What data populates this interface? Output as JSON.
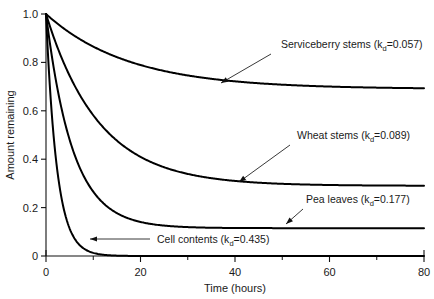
{
  "chart_data": {
    "type": "line",
    "title": "",
    "xlabel": "Time (hours)",
    "ylabel": "Amount remaining",
    "xlim": [
      0,
      80
    ],
    "ylim": [
      0,
      1.0
    ],
    "xticks": [
      0,
      20,
      40,
      60,
      80
    ],
    "xtick_labels": [
      "0",
      "20",
      "40",
      "60",
      "80"
    ],
    "xminor_ticks": [
      10,
      30,
      50,
      70
    ],
    "yticks": [
      0,
      0.2,
      0.4,
      0.6,
      0.8,
      1.0
    ],
    "ytick_labels": [
      "0",
      "0.2",
      "0.4",
      "0.6",
      "0.8",
      "1.0"
    ],
    "grid": false,
    "legend": "annotations-with-arrows",
    "model": "A(t) = asymptote + (1 - asymptote) * exp(-kd * t)",
    "series": [
      {
        "name": "Serviceberry stems",
        "kd": 0.057,
        "label": "Serviceberry stems (kd=0.057)",
        "label_prefix": "Serviceberry stems (k",
        "label_subscript": "d",
        "label_suffix": "=0.057)",
        "asymptote": 0.69,
        "x": [
          0,
          2,
          4,
          6,
          8,
          10,
          15,
          20,
          25,
          30,
          35,
          40,
          50,
          60,
          70,
          80
        ],
        "y": [
          1.0,
          0.967,
          0.937,
          0.91,
          0.886,
          0.865,
          0.822,
          0.789,
          0.765,
          0.747,
          0.734,
          0.724,
          0.711,
          0.703,
          0.699,
          0.697
        ]
      },
      {
        "name": "Wheat stems",
        "kd": 0.089,
        "label": "Wheat stems (kd=0.089)",
        "label_prefix": "Wheat stems (k",
        "label_subscript": "d",
        "label_suffix": "=0.089)",
        "asymptote": 0.29,
        "x": [
          0,
          2,
          4,
          6,
          8,
          10,
          15,
          20,
          25,
          30,
          35,
          40,
          50,
          60,
          70,
          80
        ],
        "y": [
          1.0,
          0.884,
          0.787,
          0.706,
          0.638,
          0.582,
          0.476,
          0.41,
          0.367,
          0.339,
          0.322,
          0.31,
          0.298,
          0.293,
          0.291,
          0.29
        ]
      },
      {
        "name": "Pea leaves",
        "kd": 0.177,
        "label": "Pea leaves (kd=0.177)",
        "label_prefix": "Pea leaves (k",
        "label_subscript": "d",
        "label_suffix": "=0.177)",
        "asymptote": 0.115,
        "x": [
          0,
          2,
          4,
          6,
          8,
          10,
          15,
          20,
          25,
          30,
          35,
          40,
          50,
          60,
          70,
          80
        ],
        "y": [
          1.0,
          0.736,
          0.551,
          0.421,
          0.33,
          0.266,
          0.178,
          0.141,
          0.126,
          0.12,
          0.117,
          0.116,
          0.115,
          0.115,
          0.115,
          0.115
        ]
      },
      {
        "name": "Cell contents",
        "kd": 0.435,
        "label": "Cell contents (kd=0.435)",
        "label_prefix": "Cell contents (k",
        "label_subscript": "d",
        "label_suffix": "=0.435)",
        "asymptote": 0.0,
        "x": [
          0,
          2,
          4,
          6,
          8,
          10,
          12,
          15,
          20,
          25,
          30,
          40,
          50,
          60,
          70,
          80
        ],
        "y": [
          1.0,
          0.419,
          0.175,
          0.073,
          0.031,
          0.013,
          0.005,
          0.0015,
          0.0002,
          0.0,
          0.0,
          0.0,
          0.0,
          0.0,
          0.0,
          0.0
        ]
      }
    ],
    "annotations": [
      {
        "series": "Serviceberry stems",
        "text_x": 281,
        "text_y": 48,
        "arrow_from_x": 271,
        "arrow_from_y": 54,
        "arrow_to_x": 221,
        "arrow_to_y": 83
      },
      {
        "series": "Wheat stems",
        "text_x": 297,
        "text_y": 139,
        "arrow_from_x": 290,
        "arrow_from_y": 145,
        "arrow_to_x": 239,
        "arrow_to_y": 182
      },
      {
        "series": "Pea leaves",
        "text_x": 306,
        "text_y": 203,
        "arrow_from_x": 303,
        "arrow_from_y": 209,
        "arrow_to_x": 286,
        "arrow_to_y": 224
      },
      {
        "series": "Cell contents",
        "text_x": 157,
        "text_y": 243,
        "arrow_from_x": 150,
        "arrow_from_y": 239,
        "arrow_to_x": 90,
        "arrow_to_y": 239
      }
    ]
  },
  "axes": {
    "x_title": "Time (hours)",
    "y_title": "Amount remaining"
  }
}
